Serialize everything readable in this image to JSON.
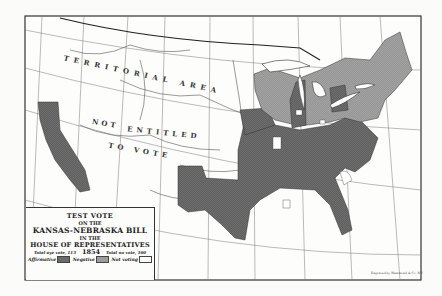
{
  "map": {
    "title_lines": [
      "TEST VOTE",
      "ON THE",
      "KANSAS-NEBRASKA BILL",
      "IN THE",
      "HOUSE OF REPRESENTATIVES",
      "1854"
    ],
    "totals": {
      "aye": "Total aye vote, 113",
      "no": "Total no vote, 100"
    },
    "legend": [
      {
        "label": "Affirmative",
        "color": "#6b6b6b"
      },
      {
        "label": "Negative",
        "color": "#9c9c9c"
      },
      {
        "label": "Not voting",
        "color": "#ffffff"
      }
    ],
    "region_labels": {
      "territorial": "TERRITORIAL AREA",
      "not": "NOT",
      "entitled": "ENTITLED",
      "to_vote": "TO VOTE"
    },
    "top_labels": [
      "Longitude",
      "West",
      "Greenwich"
    ],
    "credit": "Engraved by Hammond & Co. N.Y.",
    "colors": {
      "affirmative": "#6b6b6b",
      "negative": "#9c9c9c",
      "not_voting": "#ffffff",
      "frame": "#333333"
    }
  }
}
